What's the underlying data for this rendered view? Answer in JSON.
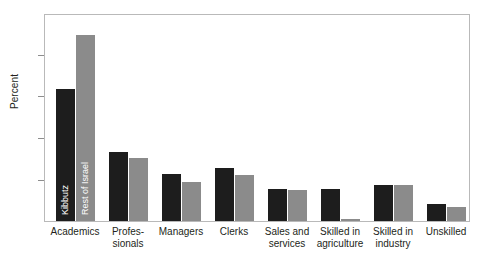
{
  "chart_data": {
    "type": "bar",
    "title": "",
    "xlabel": "",
    "ylabel": "Percent",
    "ylim": [
      0,
      50
    ],
    "yticks": [
      0,
      10,
      20,
      30,
      40,
      50
    ],
    "grid": false,
    "legend_position": "inside-first-bars",
    "categories": [
      "Academics",
      "Profes-\nsionals",
      "Managers",
      "Clerks",
      "Sales and\nservices",
      "Skilled in\nagriculture",
      "Skilled in\nindustry",
      "Unskilled"
    ],
    "series": [
      {
        "name": "Kibbutz",
        "color": "#1d1d1d",
        "values": [
          31.8,
          16.6,
          11.4,
          12.7,
          7.8,
          7.8,
          8.8,
          4.2
        ]
      },
      {
        "name": "Rest of Israel",
        "color": "#8b8b8b",
        "values": [
          45.0,
          15.1,
          9.5,
          11.0,
          7.5,
          0.6,
          8.6,
          3.3
        ]
      }
    ]
  },
  "axis": {
    "y_title": "Percent",
    "tick_labels": [
      "50",
      "40",
      "30",
      "20",
      "10",
      "0"
    ]
  },
  "legend": {
    "kibbutz": "Kibbutz",
    "rest_of_israel": "Rest of Israel"
  },
  "x_labels": [
    {
      "line1": "Academics",
      "line2": ""
    },
    {
      "line1": "Profes-",
      "line2": "sionals"
    },
    {
      "line1": "Managers",
      "line2": ""
    },
    {
      "line1": "Clerks",
      "line2": ""
    },
    {
      "line1": "Sales and",
      "line2": "services"
    },
    {
      "line1": "Skilled in",
      "line2": "agriculture"
    },
    {
      "line1": "Skilled in",
      "line2": "industry"
    },
    {
      "line1": "Unskilled",
      "line2": ""
    }
  ],
  "colors": {
    "kibbutz": "#1d1d1d",
    "rest_of_israel": "#8b8b8b",
    "frame": "#b9b9b9",
    "text": "#231f20",
    "background": "#ffffff"
  }
}
